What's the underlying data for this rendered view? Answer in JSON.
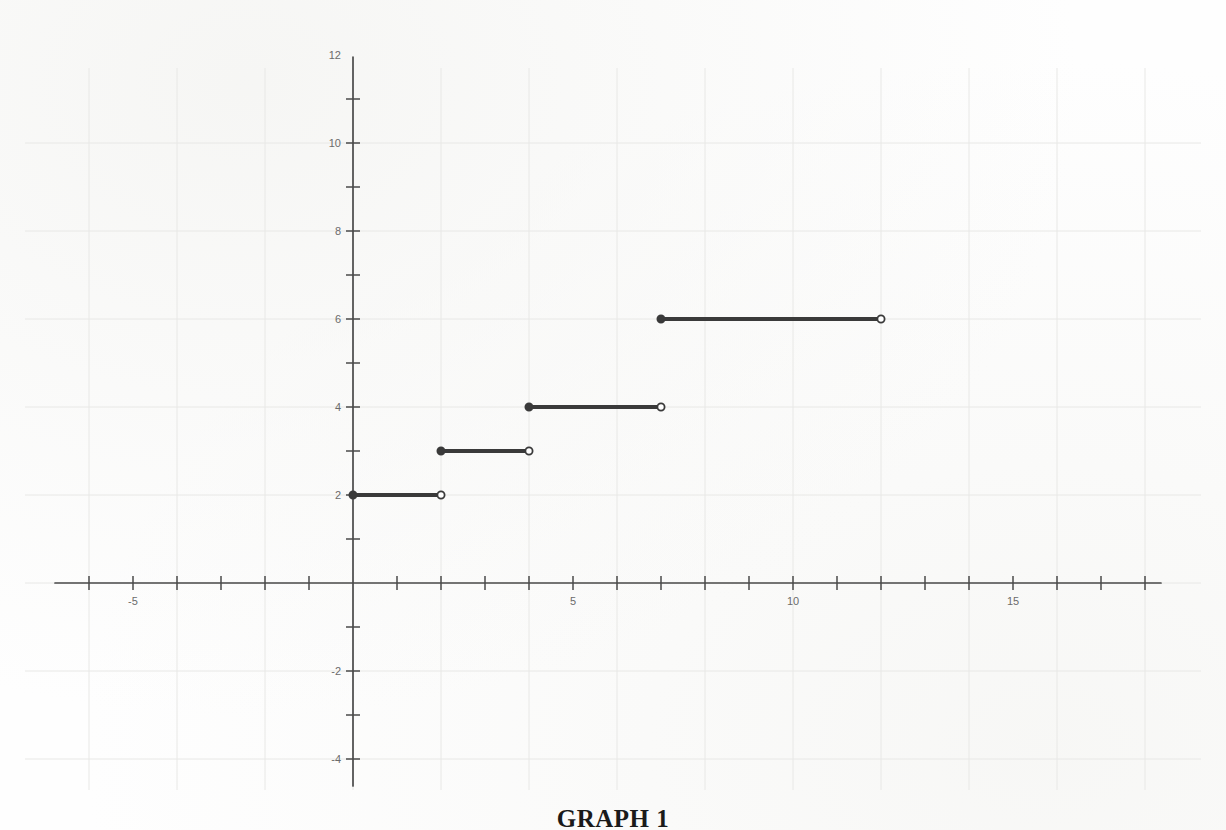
{
  "caption": "GRAPH 1",
  "colors": {
    "grid": "#e8e8e6",
    "axis": "#4a4a4a",
    "curve": "#3a3a3a",
    "label": "#6b6b6b",
    "background": "#fefefe",
    "caption": "#1a1a1a"
  },
  "axes": {
    "x_labels": [
      "-5",
      "5",
      "10",
      "15"
    ],
    "y_labels": [
      "12",
      "10",
      "8",
      "6",
      "4",
      "2",
      "-2",
      "-4"
    ],
    "x_label_values": [
      -5,
      5,
      10,
      15
    ],
    "y_label_values": [
      12,
      10,
      8,
      6,
      4,
      2,
      -2,
      -4
    ],
    "x_tick_step": 1,
    "y_tick_step": 1,
    "grid_step": 2,
    "origin_px": [
      353,
      583
    ],
    "unit_px": 44
  },
  "chart_data": {
    "type": "line",
    "title": "GRAPH 1",
    "subtitle": "",
    "xlabel": "",
    "ylabel": "",
    "xlim": [
      -7,
      18.3
    ],
    "ylim": [
      -5,
      12.5
    ],
    "grid": true,
    "legend": null,
    "series": [
      {
        "name": "step-function",
        "style": "step",
        "segments": [
          {
            "x_start": 0,
            "x_end": 2,
            "y": 2,
            "left_closed": true,
            "right_closed": false
          },
          {
            "x_start": 2,
            "x_end": 4,
            "y": 3,
            "left_closed": true,
            "right_closed": false
          },
          {
            "x_start": 4,
            "x_end": 7,
            "y": 4,
            "left_closed": true,
            "right_closed": false
          },
          {
            "x_start": 7,
            "x_end": 12,
            "y": 6,
            "left_closed": true,
            "right_closed": false
          }
        ]
      }
    ],
    "x_tick_labels": [
      "-5",
      "5",
      "10",
      "15"
    ],
    "y_tick_labels": [
      "12",
      "10",
      "8",
      "6",
      "4",
      "2",
      "-2",
      "-4"
    ]
  }
}
